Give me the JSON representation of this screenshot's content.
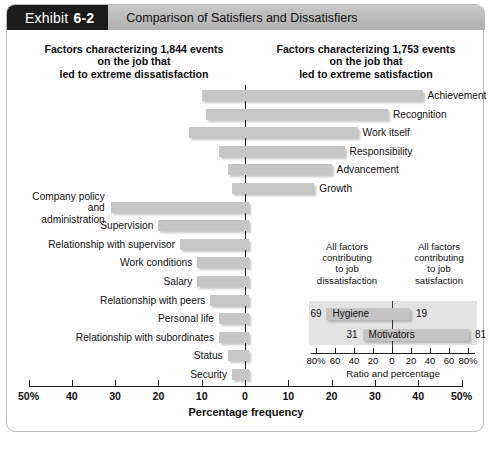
{
  "header": {
    "tag_word": "Exhibit",
    "tag_number": "6-2",
    "title": "Comparison of Satisfiers and Dissatisfiers"
  },
  "headings": {
    "left": "Factors characterizing 1,844 events\non the job that\nled to extreme dissatisfaction",
    "left_line1": "Factors characterizing 1,844 events",
    "left_line2": "on the job that",
    "left_line3": "led to extreme dissatisfaction",
    "right_line1": "Factors characterizing 1,753 events",
    "right_line2": "on the job that",
    "right_line3": "led to extreme satisfaction"
  },
  "axis": {
    "caption": "Percentage frequency",
    "tick_labels": [
      "50%",
      "40",
      "30",
      "20",
      "10",
      "0",
      "10",
      "20",
      "30",
      "40",
      "50%"
    ],
    "tick_values": [
      -50,
      -40,
      -30,
      -20,
      -10,
      0,
      10,
      20,
      30,
      40,
      50
    ]
  },
  "inset": {
    "caption_left": "All factors\ncontributing\nto job\ndissatisfaction",
    "caption_left_lines": [
      "All factors",
      "contributing",
      "to job",
      "dissatisfaction"
    ],
    "caption_right_lines": [
      "All factors",
      "contributing",
      "to job",
      "satisfaction"
    ],
    "axis_caption": "Ratio and percentage",
    "tick_labels": [
      "80%",
      "60",
      "40",
      "20",
      "0",
      "20",
      "40",
      "60",
      "80%"
    ],
    "tick_values": [
      -80,
      -60,
      -40,
      -20,
      0,
      20,
      40,
      60,
      80
    ],
    "rows": [
      {
        "name": "Hygiene",
        "left_value": "69",
        "right_value": "19",
        "left": 69,
        "right": 19
      },
      {
        "name": "Motivators",
        "left_value": "31",
        "right_value": "81",
        "left": 31,
        "right": 81
      }
    ]
  },
  "chart_data": {
    "type": "bar",
    "title": "Comparison of Satisfiers and Dissatisfiers",
    "xlabel": "Percentage frequency",
    "ylabel": "",
    "xlim": [
      -50,
      50
    ],
    "grid": false,
    "legend": "none",
    "note": "Diverging bar chart. Negative (left) = dissatisfaction frequency, positive (right) = satisfaction frequency.",
    "categories": [
      "Achievement",
      "Recognition",
      "Work itself",
      "Responsibility",
      "Advancement",
      "Growth",
      "Company policy and administration",
      "Supervision",
      "Relationship with supervisor",
      "Work conditions",
      "Salary",
      "Relationship with peers",
      "Personal life",
      "Relationship with subordinates",
      "Status",
      "Security"
    ],
    "series": [
      {
        "name": "Dissatisfaction (left extent, %)",
        "values": [
          10,
          9,
          13,
          6,
          4,
          3,
          31,
          20,
          15,
          11,
          11,
          8,
          6,
          6,
          4,
          3
        ]
      },
      {
        "name": "Satisfaction (right extent, %)",
        "values": [
          41,
          33,
          26,
          23,
          20,
          16,
          1,
          1,
          1,
          1,
          1,
          1,
          1,
          1,
          1,
          1
        ]
      }
    ],
    "bars": [
      {
        "label": "Achievement",
        "left": 10,
        "right": 41,
        "label_side": "right"
      },
      {
        "label": "Recognition",
        "left": 9,
        "right": 33,
        "label_side": "right"
      },
      {
        "label": "Work itself",
        "left": 13,
        "right": 26,
        "label_side": "right"
      },
      {
        "label": "Responsibility",
        "left": 6,
        "right": 23,
        "label_side": "right"
      },
      {
        "label": "Advancement",
        "left": 4,
        "right": 20,
        "label_side": "right"
      },
      {
        "label": "Growth",
        "left": 3,
        "right": 16,
        "label_side": "right"
      },
      {
        "label": "Company policy and administration",
        "left": 31,
        "right": 1,
        "label_side": "left",
        "multiline": true
      },
      {
        "label": "Supervision",
        "left": 20,
        "right": 1,
        "label_side": "left"
      },
      {
        "label": "Relationship with supervisor",
        "left": 15,
        "right": 1,
        "label_side": "left"
      },
      {
        "label": "Work conditions",
        "left": 11,
        "right": 1,
        "label_side": "left"
      },
      {
        "label": "Salary",
        "left": 11,
        "right": 1,
        "label_side": "left"
      },
      {
        "label": "Relationship with peers",
        "left": 8,
        "right": 1,
        "label_side": "left"
      },
      {
        "label": "Personal life",
        "left": 6,
        "right": 1,
        "label_side": "left"
      },
      {
        "label": "Relationship with subordinates",
        "left": 6,
        "right": 1,
        "label_side": "left"
      },
      {
        "label": "Status",
        "left": 4,
        "right": 1,
        "label_side": "left"
      },
      {
        "label": "Security",
        "left": 3,
        "right": 1,
        "label_side": "left"
      }
    ]
  },
  "colors": {
    "bar": "#c6c6c6",
    "header_tag_bg": "#1b1b1b",
    "header_title_bg": "#bdbdbd",
    "inset_panel_bg": "#e3e3e3",
    "axis": "#1d1d1d"
  }
}
